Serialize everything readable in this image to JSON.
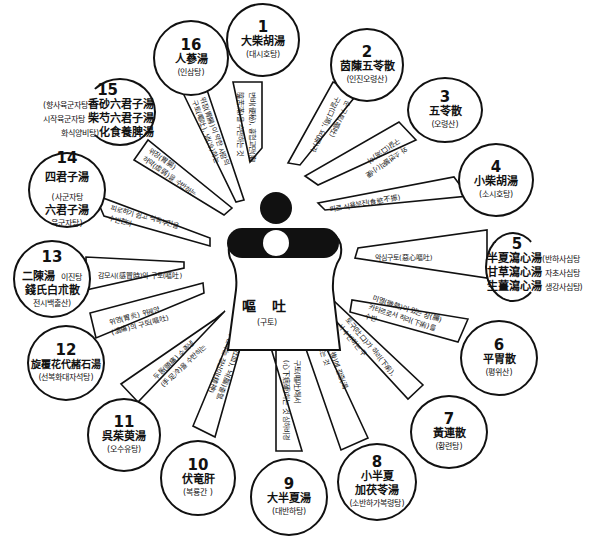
{
  "center": {
    "title": "嘔 吐",
    "subtitle": "(구토)"
  },
  "nodes": [
    {
      "num": "1",
      "hanja": "大柴胡湯",
      "hangul": "(대시호탕)"
    },
    {
      "num": "2",
      "hanja": "茵蔯五苓散",
      "hangul": "(인진오령산)"
    },
    {
      "num": "3",
      "hanja": "五苓散",
      "hangul": "(오령산)"
    },
    {
      "num": "4",
      "hanja": "小柴胡湯",
      "hangul": "(소시호탕)"
    },
    {
      "num": "5",
      "hanja": [
        "半夏瀉心湯",
        "甘草瀉心湯",
        "生薑瀉心湯"
      ],
      "hangul": [
        "(반하사심탕",
        "자초사심탕",
        "생강사심탕)"
      ]
    },
    {
      "num": "6",
      "hanja": "平胃散",
      "hangul": "(평위산)"
    },
    {
      "num": "7",
      "hanja": "黃連散",
      "hangul": "(황련탕)"
    },
    {
      "num": "8",
      "hanja": [
        "小半夏",
        "加茯苓湯"
      ],
      "hangul": "(소반하가복령탕)"
    },
    {
      "num": "9",
      "hanja": "大半夏湯",
      "hangul": "(대반하탕)"
    },
    {
      "num": "10",
      "hanja": "伏竜肝",
      "hangul": "(복룡간 )"
    },
    {
      "num": "11",
      "hanja": "呉茱萸湯",
      "hangul": "(오수유탕)"
    },
    {
      "num": "12",
      "hanja": "旋覆花代赭石湯",
      "hangul": "(선복화대자석탕)"
    },
    {
      "num": "13",
      "hanja": [
        "二陳湯",
        "錢氏白朮散"
      ],
      "hangul": [
        "이진탕",
        "전시백출산)"
      ]
    },
    {
      "num": "14",
      "hanja": [
        "四君子湯",
        "六君子湯"
      ],
      "hangul": [
        "(사군자탕",
        "육군자탕)"
      ]
    },
    {
      "num": "15",
      "hanja": [
        "香砂六君子湯",
        "柴芍六君子湯",
        "化食養脾湯"
      ],
      "hangul": [
        "(향사육군자탕",
        "시작육군자탕",
        "화식양비탕)"
      ]
    },
    {
      "num": "16",
      "hanja": "人蔘湯",
      "hangul": "(인삼탕)"
    }
  ],
  "spokes": [
    {
      "to": "1",
      "lines": [
        "변비(便秘), 흉협고만(胸",
        "脇苦滿)을 수반하는 것"
      ]
    },
    {
      "to": "2",
      "lines": [
        "구갈(口渴), 요(尿)가",
        "순 구토(嘔吐)",
        "적"
      ]
    },
    {
      "to": "3",
      "lines": [
        "구갈(口渴)이",
        "와 소변불리(小便",
        "不利)"
      ]
    },
    {
      "to": "4",
      "lines": [
        "피로 식욕부진(食慾不振)"
      ]
    },
    {
      "to": "5",
      "lines": [
        "악심구토(惡心嘔吐)"
      ]
    },
    {
      "to": "6",
      "lines": [
        "미열(微熱)이 있는 장(腸)",
        "카타르로서 하리(下痢)를",
        "수반"
      ]
    },
    {
      "to": "7",
      "lines": [
        "토구(吐口)가 하리(下痢),",
        "서 수반하는 구",
        "(心口)을 수반하는"
      ]
    },
    {
      "to": "8",
      "lines": [
        "구토후(嘔吐後)에 갈증(渴",
        "症)이 나오는 것"
      ]
    },
    {
      "to": "9",
      "lines": [
        "구토(嘔吐)해서",
        "(心下痞硬)하는 것 심하비경"
      ]
    },
    {
      "to": "10",
      "lines": [
        "토혈(吐血), 뇌(腦)출혈,",
        "수반하는 정신이(精神)"
      ]
    },
    {
      "to": "11",
      "lines": [
        "두통(頭痛) 수족냉",
        "(手足冷)을 수반하는"
      ]
    },
    {
      "to": "12",
      "lines": [
        "위영(胃炎) 위궤양",
        "(潰瘍)의 구토(嘔吐)"
      ]
    },
    {
      "to": "13",
      "lines": [
        "감모시(感冒時)의 구토(嘔吐)"
      ]
    },
    {
      "to": "14",
      "lines": [
        "피로하기 쉽고 식욕부진을",
        "수반한다"
      ]
    },
    {
      "to": "15",
      "lines": [
        "위장(胃腸)",
        "허약(虛弱)을 수반하는"
      ]
    },
    {
      "to": "16",
      "lines": [
        "위장(胃腸)이 약한 사람의",
        "구토(嘔吐), 냉(冷)하는",
        "수족(手足)"
      ]
    }
  ],
  "colors": {
    "ink": "#111111",
    "background": "#ffffff"
  }
}
